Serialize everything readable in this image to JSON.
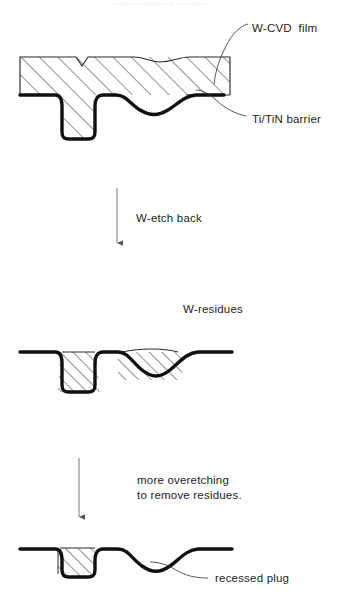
{
  "figure": {
    "caption_faint": "w-plug formation by etch back",
    "stages": [
      {
        "id": "stage-1-as-deposited",
        "labels": [
          {
            "name": "w-cvd-film-label",
            "text": "W-CVD  film",
            "x": 252,
            "y": 21
          },
          {
            "name": "ti-tin-barrier-label",
            "text": "Ti/TiN barrier",
            "x": 252,
            "y": 112
          }
        ]
      },
      {
        "id": "stage-2-after-etch-back",
        "labels": [
          {
            "name": "w-etch-back-label",
            "text": "W-etch back",
            "x": 136,
            "y": 211
          },
          {
            "name": "w-residues-label",
            "text": "W-residues",
            "x": 183,
            "y": 302
          }
        ]
      },
      {
        "id": "stage-3-after-overetch",
        "labels": [
          {
            "name": "more-overetching-line-1",
            "text": "more overetching",
            "x": 137,
            "y": 473
          },
          {
            "name": "more-overetching-line-2",
            "text": "to remove residues.",
            "x": 137,
            "y": 488
          },
          {
            "name": "recessed-plug-label",
            "text": "recessed plug",
            "x": 215,
            "y": 578
          }
        ]
      }
    ],
    "colors": {
      "ink": "#1a1a1a",
      "barrier": "#101010",
      "hatch": "#2b2b2b",
      "outline": "#2a2a2a",
      "background": "#ffffff",
      "faint_text": "#f4f4f6"
    },
    "annotations": {
      "arrow_1_name": "process-arrow-etch-back",
      "arrow_2_name": "process-arrow-overetch",
      "leader_1_name": "leader-line-w-cvd-film",
      "leader_2_name": "leader-line-ti-tin-barrier",
      "leader_3_name": "leader-line-recessed-plug"
    }
  }
}
